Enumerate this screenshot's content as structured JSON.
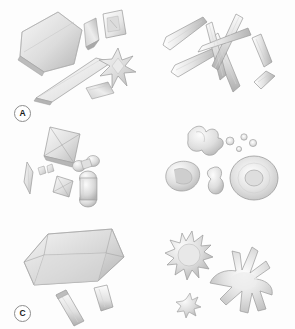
{
  "figure": {
    "background_color": "#fdfdfd",
    "layout": "2 columns x 3 rows",
    "width": 295,
    "height": 329,
    "render_style": "grayscale shaded 3D crystal illustrations",
    "palette": {
      "crystal_light": "#fbfbfb",
      "crystal_mid": "#d9d9d9",
      "crystal_shadow": "#a8a8a8",
      "crystal_dark": "#8f8f8f",
      "outline": "#9a9a9a",
      "label_text": "#1b1b1b",
      "label_border": "#8d8d8d"
    }
  },
  "panels": [
    {
      "id": "a",
      "label": "A",
      "morphology": "plate-like tabular crystals with star rosette",
      "objects": [
        {
          "name": "large-hexagonal-plate",
          "shape": "hexagonal-plate"
        },
        {
          "name": "elongated-plate",
          "shape": "long-tabular-plate"
        },
        {
          "name": "folded-plate",
          "shape": "bent-plate"
        },
        {
          "name": "rectangular-plate",
          "shape": "rectangular-plate"
        },
        {
          "name": "small-plate",
          "shape": "small-rhombic-plate"
        },
        {
          "name": "star-rosette",
          "shape": "radiating-star-cluster"
        }
      ]
    },
    {
      "id": "b",
      "label": "B",
      "morphology": "acicular needle and blade crystals",
      "objects": [
        {
          "name": "needle-cluster",
          "shape": "crossed-needle-aggregate"
        },
        {
          "name": "blade-upper-left",
          "shape": "elongated-blade"
        },
        {
          "name": "blade-lower-left",
          "shape": "elongated-blade"
        },
        {
          "name": "blade-right",
          "shape": "elongated-blade"
        },
        {
          "name": "blade-lower-right",
          "shape": "short-blade"
        }
      ]
    },
    {
      "id": "c",
      "label": "C",
      "morphology": "bipyramidal envelope crystals and dumbbells",
      "objects": [
        {
          "name": "large-bipyramid",
          "shape": "square-bipyramid-envelope"
        },
        {
          "name": "small-bipyramid",
          "shape": "square-bipyramid-envelope"
        },
        {
          "name": "spindle",
          "shape": "lenticular-spindle"
        },
        {
          "name": "small-dumbbell",
          "shape": "dumbbell"
        },
        {
          "name": "large-dumbbell",
          "shape": "dumbbell"
        },
        {
          "name": "micro-crystals",
          "shape": "tiny-prisms"
        }
      ]
    },
    {
      "id": "d",
      "label": "D",
      "morphology": "rounded botryoidal and amorphous aggregates",
      "objects": [
        {
          "name": "lobed-aggregate",
          "shape": "irregular-lobed-mass"
        },
        {
          "name": "shell-form",
          "shape": "concave-shell"
        },
        {
          "name": "peanut-form",
          "shape": "peanut-shaped-body"
        },
        {
          "name": "disc-with-depression",
          "shape": "disc-with-central-pit"
        },
        {
          "name": "micro-spheres",
          "shape": "small-spheres"
        }
      ]
    },
    {
      "id": "e",
      "label": "E",
      "morphology": "large coffin-lid prismatic crystal with rods",
      "objects": [
        {
          "name": "coffin-lid-crystal",
          "shape": "beveled-rectangular-prism"
        },
        {
          "name": "rod-left",
          "shape": "elongated-rod"
        },
        {
          "name": "rod-right",
          "shape": "short-rod"
        }
      ]
    },
    {
      "id": "f",
      "label": "F",
      "morphology": "spiky spherulitic aggregates with radiating spines",
      "objects": [
        {
          "name": "spiky-spherulite",
          "shape": "sun-like-spiny-sphere"
        },
        {
          "name": "large-spined-mass",
          "shape": "irregular-mass-with-spines"
        },
        {
          "name": "small-spiky-form",
          "shape": "small-spiny-body"
        }
      ]
    }
  ]
}
